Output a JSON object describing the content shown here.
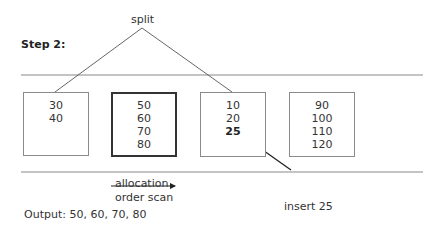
{
  "title": "Step 2:",
  "split_label": "split",
  "pages": [
    {
      "values": [
        "30",
        "40"
      ],
      "highlighted": false
    },
    {
      "values": [
        "50",
        "60",
        "70",
        "80"
      ],
      "highlighted": true
    },
    {
      "values": [
        "10",
        "20",
        "25"
      ],
      "highlighted": false,
      "bold_index": 2
    },
    {
      "values": [
        "90",
        "100",
        "110",
        "120"
      ],
      "highlighted": false
    }
  ],
  "scan_arrow": {
    "label_top": "allocation",
    "label_bottom": "order scan"
  },
  "insert_label": "insert 25",
  "output_text": "Output: 50, 60, 70, 80",
  "colors": {
    "line": "#8a8a8a",
    "thin_line": "#555555",
    "arrow": "#222222",
    "text": "#333333"
  }
}
